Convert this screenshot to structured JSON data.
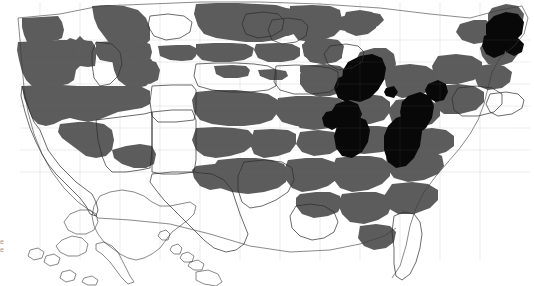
{
  "figure": {
    "type": "choropleth-map",
    "region": "United States (counties)",
    "width": 534,
    "height": 286,
    "background_color": "#ffffff",
    "has_title": false,
    "has_legend": false,
    "has_axes": false
  },
  "colors": {
    "unshaded": "#ffffff",
    "mid": "#5c5c5c",
    "high": "#080808",
    "boundary": "#3a3a3a",
    "state_boundary": "#2b2b2b",
    "county_boundary": "#777777"
  },
  "classes": [
    {
      "key": "unshaded",
      "label": "",
      "color": "#ffffff"
    },
    {
      "key": "mid",
      "label": "",
      "color": "#5c5c5c"
    },
    {
      "key": "high",
      "label": "",
      "color": "#080808"
    }
  ],
  "insets": [
    {
      "name": "alaska-inset",
      "shading": "unshaded"
    },
    {
      "name": "hawaii-inset",
      "shading": "unshaded"
    }
  ],
  "edge_text": {
    "line1": "e",
    "line2": "e"
  },
  "chart_data": {
    "type": "map",
    "title": "",
    "xlabel": "",
    "ylabel": "",
    "legend": [],
    "categories": [
      "unshaded",
      "mid",
      "high"
    ],
    "values": [
      0,
      1,
      2
    ]
  }
}
